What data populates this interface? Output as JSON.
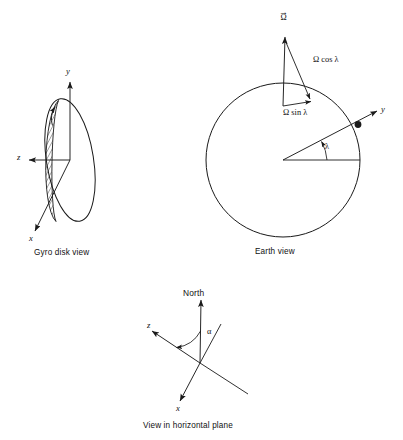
{
  "figure": {
    "stroke_color": "#1a1a1a",
    "background": "#ffffff",
    "panels": [
      {
        "id": "gyro-disk-view",
        "caption": "Gyro disk view",
        "axes": [
          {
            "name": "y",
            "label": "y",
            "direction": "up"
          },
          {
            "name": "z",
            "label": "z",
            "direction": "left"
          },
          {
            "name": "x",
            "label": "x",
            "direction": "down-left"
          }
        ],
        "elements": [
          "disk-ellipse",
          "hatched-rim",
          "spin-arrow"
        ]
      },
      {
        "id": "earth-view",
        "caption": "Earth view",
        "axes": [
          {
            "name": "y",
            "label": "y",
            "direction": "up-right"
          }
        ],
        "vectors": [
          {
            "name": "omega",
            "label": "Ω",
            "accent": "vector-arrow"
          },
          {
            "name": "omega-cos-lambda",
            "label": "Ω cos λ"
          },
          {
            "name": "omega-sin-lambda",
            "label": "Ω sin λ"
          }
        ],
        "angles": [
          {
            "name": "lambda",
            "label": "λ"
          }
        ],
        "elements": [
          "earth-circle",
          "observer-dot",
          "equator-radius"
        ]
      },
      {
        "id": "horizontal-plane-view",
        "caption": "View in horizontal plane",
        "axes": [
          {
            "name": "north",
            "label": "North",
            "direction": "up"
          },
          {
            "name": "z",
            "label": "z",
            "direction": "up-left"
          },
          {
            "name": "x",
            "label": "x",
            "direction": "down-left"
          }
        ],
        "angles": [
          {
            "name": "alpha",
            "label": "α"
          }
        ]
      }
    ]
  },
  "labels": {
    "gyro_caption": "Gyro disk view",
    "gyro_y": "y",
    "gyro_z": "z",
    "gyro_x": "x",
    "earth_caption": "Earth view",
    "earth_y": "y",
    "omega_bar": "→",
    "omega_sym": "Ω",
    "omega_cos": "Ω cos λ",
    "omega_sin": "Ω sin λ",
    "lambda": "λ",
    "north": "North",
    "horiz_z": "z",
    "horiz_x": "x",
    "alpha": "α",
    "horiz_caption": "View in horizontal plane"
  }
}
